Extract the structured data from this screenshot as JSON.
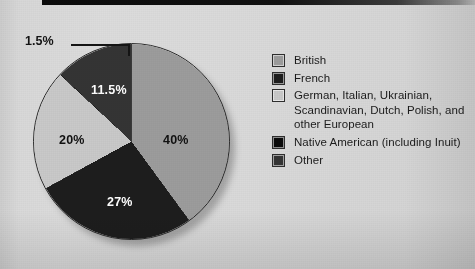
{
  "chart_data": {
    "type": "pie",
    "title": "",
    "subtitle": "",
    "xlabel": "",
    "ylabel": "",
    "legend_position": "right",
    "grid": false,
    "categories": [
      "British",
      "French",
      "German, Italian, Ukrainian, Scandinavian, Dutch, Polish, and other European",
      "Native American (including Inuit)",
      "Other"
    ],
    "values": [
      40,
      27,
      20,
      1.5,
      11.5
    ],
    "value_labels": [
      "40%",
      "27%",
      "20%",
      "1.5%",
      "11.5%"
    ],
    "colors": [
      "#9c9c9c",
      "#1d1d1d",
      "#c9c9c9",
      "#0a0a0a",
      "#343434"
    ],
    "annotations": [
      {
        "text": "1.5%",
        "points_to": "Native American (including Inuit)",
        "style": "leader-line"
      }
    ]
  },
  "pie": {
    "slices": [
      {
        "name": "british",
        "label": "40%",
        "value": 40,
        "color": "#9c9c9c",
        "label_color": "dark",
        "label_left": "130px",
        "label_top": "90px"
      },
      {
        "name": "french",
        "label": "27%",
        "value": 27,
        "color": "#1d1d1d",
        "label_color": "light",
        "label_left": "74px",
        "label_top": "152px"
      },
      {
        "name": "european",
        "label": "20%",
        "value": 20,
        "color": "#c9c9c9",
        "label_color": "dark",
        "label_left": "26px",
        "label_top": "90px"
      },
      {
        "name": "native-american",
        "label": "1.5%",
        "value": 1.5,
        "color": "#0a0a0a",
        "label_color": "dark",
        "label_left": "",
        "label_top": ""
      },
      {
        "name": "other",
        "label": "11.5%",
        "value": 11.5,
        "color": "#343434",
        "label_color": "light",
        "label_left": "58px",
        "label_top": "40px"
      }
    ],
    "callout": {
      "label": "1.5%"
    }
  },
  "legend": {
    "items": [
      {
        "name": "british",
        "label": "British",
        "color": "#9c9c9c"
      },
      {
        "name": "french",
        "label": "French",
        "color": "#1d1d1d"
      },
      {
        "name": "european",
        "label": "German, Italian, Ukrainian, Scandinavian, Dutch, Polish, and other European",
        "color": "#c9c9c9"
      },
      {
        "name": "native-american",
        "label": "Native American (including Inuit)",
        "color": "#0a0a0a"
      },
      {
        "name": "other",
        "label": "Other",
        "color": "#343434"
      }
    ]
  }
}
